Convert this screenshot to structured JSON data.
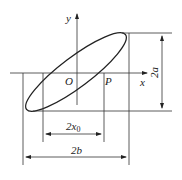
{
  "diagram": {
    "labels": {
      "y_axis": "y",
      "x_axis": "x",
      "origin": "O",
      "point_p": "P",
      "dim_height": "2a",
      "dim_inner_width_base": "2x",
      "dim_inner_width_sub": "0",
      "dim_outer_width": "2b"
    },
    "colors": {
      "stroke": "#222222",
      "background": "#ffffff"
    }
  }
}
